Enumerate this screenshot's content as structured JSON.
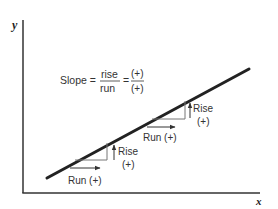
{
  "diagram": {
    "axes": {
      "y_label": "y",
      "x_label": "x",
      "color": "#333333"
    },
    "line": {
      "color": "#222222",
      "from": [
        47,
        178
      ],
      "to": [
        249,
        69
      ]
    },
    "formula": {
      "lhs": "Slope =",
      "numerator": "rise",
      "denominator": "run",
      "equals": "=",
      "sign_numerator": "(+)",
      "sign_denominator": "(+)"
    },
    "triangles": [
      {
        "rise_label": "Rise",
        "rise_sign": "(+)",
        "run_label": "Run (+)"
      },
      {
        "rise_label": "Rise",
        "rise_sign": "(+)",
        "run_label": "Run (+)"
      }
    ]
  }
}
